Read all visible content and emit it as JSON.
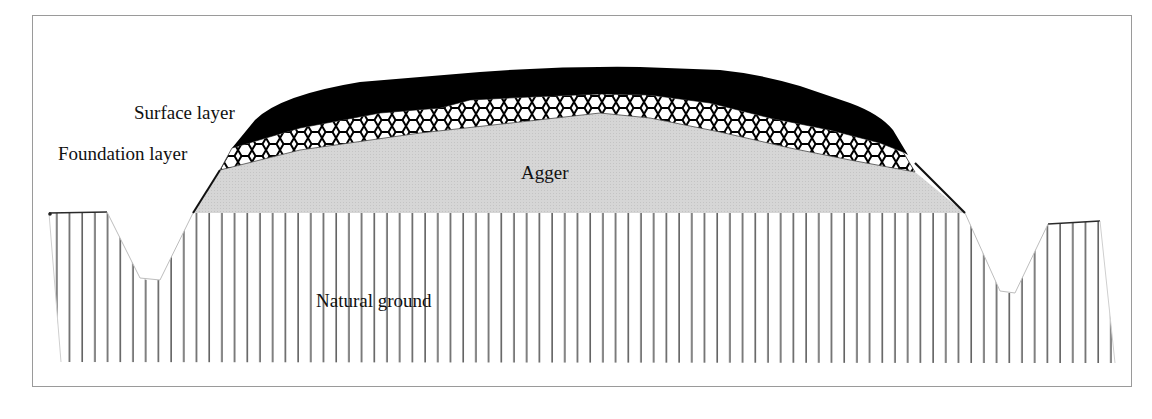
{
  "figure": {
    "layers": [
      {
        "id": "surface",
        "label": "Surface layer",
        "fill": "#000000",
        "pattern": "solid"
      },
      {
        "id": "foundation",
        "label": "Foundation layer",
        "fill": "#ffffff",
        "pattern": "hexagonal-mesh"
      },
      {
        "id": "agger",
        "label": "Agger",
        "fill": "#d4d4d4",
        "pattern": "fine-stipple"
      },
      {
        "id": "ground",
        "label": "Natural ground",
        "fill": "#ffffff",
        "pattern": "vertical-hatch"
      }
    ],
    "features": [
      "left-ditch",
      "right-ditch"
    ]
  },
  "labels": {
    "surface": "Surface layer",
    "foundation": "Foundation layer",
    "agger": "Agger",
    "ground": "Natural ground"
  },
  "colors": {
    "surface": "#000000",
    "agger": "#d4d4d4",
    "hatch": "#3a3a3a",
    "frame": "#9a9a9a"
  }
}
